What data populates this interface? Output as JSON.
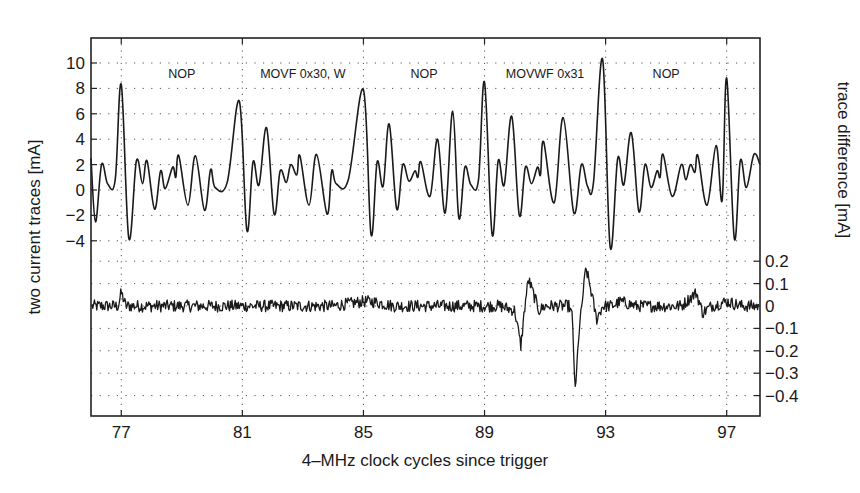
{
  "chart_data": {
    "type": "line",
    "title": "",
    "xlabel": "4–MHz clock cycles since trigger",
    "ylabel": "two current traces [mA]",
    "ylabel_right": "trace difference [mA]",
    "xlim": [
      76.0,
      98.1
    ],
    "x_ticks": [
      77,
      81,
      85,
      89,
      93,
      97
    ],
    "x_tick_labels": [
      "77",
      "81",
      "85",
      "89",
      "93",
      "97"
    ],
    "x_minor_grid_every": 4,
    "grid": true,
    "grid_style": "dotted",
    "left_axis": {
      "ylim": [
        -4.0,
        11.9
      ],
      "ticks": [
        -4,
        -2,
        0,
        2,
        4,
        6,
        8,
        10
      ],
      "tick_labels": [
        "−4",
        "−2",
        "0",
        "2",
        "4",
        "6",
        "8",
        "10"
      ]
    },
    "right_axis": {
      "ylim": [
        -0.49,
        0.3
      ],
      "ticks": [
        -0.4,
        -0.3,
        -0.2,
        -0.1,
        0,
        0.1,
        0.2
      ],
      "tick_labels": [
        "−0.4",
        "−0.3",
        "−0.2",
        "−0.1",
        "0",
        "0.1",
        "0.2"
      ]
    },
    "annotations": [
      {
        "text": "NOP",
        "x": 79.0,
        "y": 9.2
      },
      {
        "text": "MOVF 0x30, W",
        "x": 83.0,
        "y": 9.2
      },
      {
        "text": "NOP",
        "x": 87.0,
        "y": 9.2
      },
      {
        "text": "MOVWF 0x31",
        "x": 91.0,
        "y": 9.2
      },
      {
        "text": "NOP",
        "x": 95.0,
        "y": 9.2
      }
    ],
    "series": [
      {
        "name": "two current traces (overlaid)",
        "axis": "left",
        "unit": "mA",
        "x": [
          76.0,
          76.15,
          76.35,
          76.55,
          76.8,
          77.0,
          77.25,
          77.5,
          77.7,
          77.85,
          78.1,
          78.3,
          78.45,
          78.7,
          78.8,
          78.9,
          79.2,
          79.45,
          79.75,
          79.95,
          80.1,
          80.5,
          80.9,
          81.15,
          81.35,
          81.55,
          81.8,
          82.05,
          82.25,
          82.45,
          82.6,
          82.8,
          82.9,
          83.2,
          83.45,
          83.8,
          83.95,
          84.1,
          84.5,
          85.0,
          85.25,
          85.45,
          85.65,
          85.85,
          86.1,
          86.3,
          86.5,
          86.7,
          86.8,
          86.9,
          87.2,
          87.45,
          87.7,
          87.95,
          88.15,
          88.35,
          88.55,
          88.8,
          89.0,
          89.25,
          89.45,
          89.65,
          89.9,
          90.15,
          90.35,
          90.55,
          90.75,
          90.85,
          90.95,
          91.3,
          91.6,
          91.95,
          92.2,
          92.4,
          92.6,
          92.9,
          93.15,
          93.4,
          93.6,
          93.85,
          94.1,
          94.3,
          94.5,
          94.7,
          94.8,
          94.9,
          95.2,
          95.5,
          95.65,
          95.8,
          95.95,
          96.05,
          96.35,
          96.65,
          96.85,
          97.0,
          97.25,
          97.45,
          97.65,
          97.9,
          98.1
        ],
        "y": [
          2.5,
          -2.5,
          2.0,
          0.5,
          0.8,
          8.3,
          -3.8,
          2.3,
          0.5,
          2.3,
          -1.5,
          1.5,
          0.1,
          1.8,
          1.0,
          2.7,
          -1.2,
          2.7,
          -1.6,
          1.6,
          0.2,
          0.6,
          7.0,
          -3.2,
          2.2,
          0.4,
          4.9,
          -1.9,
          1.5,
          0.6,
          2.0,
          1.2,
          2.7,
          -1.2,
          2.8,
          -1.9,
          1.5,
          0.5,
          0.8,
          7.9,
          -3.5,
          2.2,
          0.3,
          5.2,
          -1.5,
          2.0,
          0.7,
          1.5,
          1.0,
          2.2,
          -0.5,
          4.0,
          -1.8,
          6.2,
          -2.2,
          1.8,
          0.4,
          0.8,
          8.5,
          -3.5,
          2.3,
          0.4,
          5.8,
          -2.0,
          1.8,
          0.5,
          1.8,
          1.2,
          3.8,
          -1.0,
          5.7,
          -1.8,
          2.0,
          0.3,
          0.6,
          10.3,
          -4.5,
          2.5,
          0.4,
          4.5,
          -1.7,
          2.0,
          0.2,
          1.5,
          1.0,
          2.8,
          -0.5,
          2.0,
          0.8,
          2.0,
          1.4,
          2.7,
          -1.2,
          3.5,
          -0.8,
          8.8,
          -3.8,
          2.3,
          0.2,
          2.8,
          2.0
        ]
      },
      {
        "name": "trace difference",
        "axis": "right",
        "unit": "mA",
        "noise_amplitude": 0.03,
        "x": [
          76.0,
          76.5,
          76.9,
          77.0,
          77.15,
          77.5,
          78.0,
          79.0,
          80.0,
          81.0,
          82.0,
          83.0,
          84.0,
          85.0,
          85.3,
          86.0,
          87.0,
          88.0,
          89.0,
          89.5,
          90.0,
          90.2,
          90.35,
          90.45,
          90.6,
          90.8,
          91.0,
          91.5,
          91.8,
          91.9,
          92.0,
          92.1,
          92.25,
          92.35,
          92.5,
          92.7,
          92.9,
          93.2,
          93.5,
          94.0,
          94.5,
          95.0,
          95.5,
          96.0,
          96.2,
          96.5,
          97.0,
          97.5,
          98.1
        ],
        "y": [
          0.0,
          0.0,
          0.0,
          0.06,
          0.0,
          0.0,
          0.0,
          0.0,
          0.0,
          0.0,
          0.0,
          0.0,
          0.0,
          0.02,
          0.02,
          0.0,
          0.0,
          0.0,
          0.0,
          0.0,
          -0.02,
          -0.18,
          0.02,
          0.12,
          0.06,
          -0.02,
          0.0,
          0.0,
          0.0,
          -0.05,
          -0.4,
          -0.15,
          0.05,
          0.17,
          0.08,
          -0.06,
          0.0,
          0.0,
          0.02,
          0.0,
          0.0,
          0.0,
          0.0,
          0.06,
          -0.03,
          0.0,
          0.02,
          0.0,
          0.0
        ]
      }
    ]
  },
  "style": {
    "line_color": "#1a1a1a",
    "grid_color": "#555555",
    "axis_color": "#222222",
    "background": "#ffffff"
  },
  "plot_box": {
    "left": 91,
    "top": 38,
    "right": 760,
    "bottom": 416
  }
}
